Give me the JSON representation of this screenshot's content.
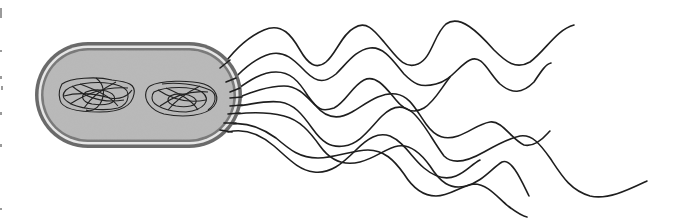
{
  "figure": {
    "colors": {
      "background": "#ffffff",
      "cytoplasm": "#b8b8b8",
      "outer_membrane": "#6a6a6a",
      "inner_membrane": "#7a7a7a",
      "periplasm_gap": "#e6e6e6",
      "dna": "#222222",
      "flagella": "#1e1e1e"
    },
    "cell": {
      "shape": "capsule",
      "x": 35,
      "y": 42,
      "width": 207,
      "height": 106
    },
    "nucleoids": [
      {
        "name": "nucleoid-left",
        "cx": 100,
        "cy": 98
      },
      {
        "name": "nucleoid-right",
        "cx": 178,
        "cy": 98
      }
    ],
    "flagella_count": 8
  }
}
